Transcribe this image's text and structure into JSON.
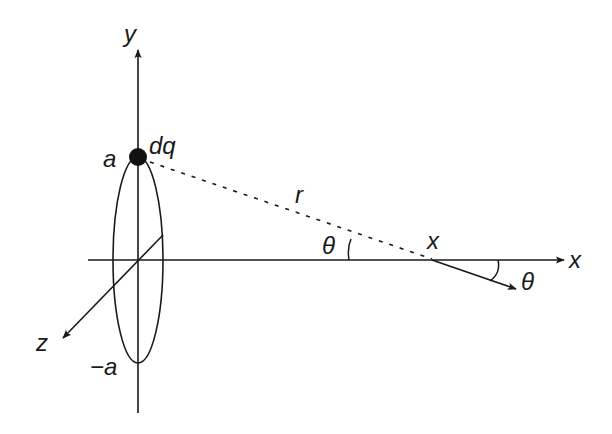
{
  "diagram": {
    "labels": {
      "y_axis": "y",
      "x_axis": "x",
      "z_axis": "z",
      "top_radius": "a",
      "bottom_radius": "−a",
      "charge_element": "dq",
      "distance": "r",
      "angle_at_point": "θ",
      "angle_of_field": "θ",
      "point": "x"
    },
    "colors": {
      "stroke": "#1a1a1a",
      "background": "#ffffff"
    }
  }
}
